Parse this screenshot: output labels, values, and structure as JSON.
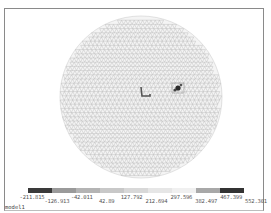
{
  "viewport": {
    "model_name": "model1",
    "mesh": "triangulated sphere surface mesh (wireframe)",
    "features": [
      {
        "name": "bracket-marker",
        "description": "small dark L-shaped highlighted element cluster near center"
      },
      {
        "name": "hotspot-marker",
        "description": "small dark highlighted element cluster right of center"
      }
    ]
  },
  "colorbar": {
    "segment_colors": [
      "#3a3a3a",
      "#9a9a9a",
      "#b4b4b4",
      "#c8c8c8",
      "#d8d8d8",
      "#e6e6e6",
      "#f0f0f0",
      "#a8a8a8",
      "#333333"
    ],
    "labels": [
      "-211.815",
      "-126.913",
      "-42.011",
      "42.89",
      "127.792",
      "212.694",
      "297.596",
      "382.497",
      "467.399",
      "552.301"
    ]
  }
}
